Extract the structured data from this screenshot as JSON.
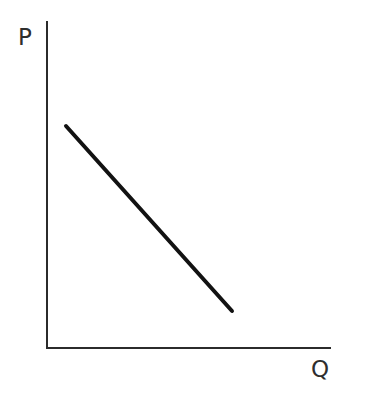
{
  "figure": {
    "background_color": "#ffffff",
    "width": 366,
    "height": 401,
    "axis_color": "#2b2b2b",
    "curve_color": "#121212",
    "label_color": "#2e2e2e"
  },
  "labels": {
    "y_axis": "P",
    "x_axis": "Q"
  },
  "chart_data": {
    "type": "line",
    "title": "",
    "subtitle": "",
    "xlabel": "Q",
    "ylabel": "P",
    "grid": false,
    "legend": null,
    "axis_arrows": false,
    "tick_labels": {
      "x": [],
      "y": []
    },
    "xlim": [
      0,
      100
    ],
    "ylim": [
      0,
      100
    ],
    "series": [
      {
        "name": "Demand",
        "label": "",
        "line_style": "solid",
        "line_width": 4,
        "color": "#121212",
        "x": [
          6.7,
          65.1
        ],
        "y": [
          67.9,
          11.3
        ],
        "pixel_start": {
          "x": 66,
          "y": 126
        },
        "pixel_end": {
          "x": 232,
          "y": 311
        }
      }
    ],
    "axes_pixels": {
      "origin": {
        "x": 47,
        "y": 348
      },
      "y_axis_top": {
        "x": 47,
        "y": 21
      },
      "x_axis_right": {
        "x": 331,
        "y": 348
      }
    },
    "annotations": []
  }
}
